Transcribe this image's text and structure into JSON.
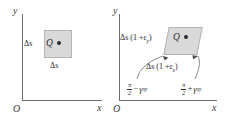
{
  "figure": {
    "panels": [
      {
        "id": "undeformed",
        "axis_y_label": "y",
        "axis_x_label": "x",
        "origin_label": "O",
        "point_label": "Q",
        "dim_left": "Δs",
        "dim_bottom": "Δs",
        "shape": "square"
      },
      {
        "id": "deformed",
        "axis_y_label": "y",
        "axis_x_label": "x",
        "origin_label": "O",
        "point_label": "Q",
        "dim_left_main": "Δs (1 +",
        "dim_left_sub": "y",
        "dim_left_close": ")",
        "dim_mid_main": "Δs (1 +",
        "dim_mid_sub": "x",
        "dim_mid_close": ")",
        "angle_left": {
          "numerator": "π",
          "denominator": "2",
          "operator": "−",
          "symbol": "γ",
          "subscript": "xy"
        },
        "angle_right": {
          "numerator": "π",
          "denominator": "2",
          "operator": "+",
          "symbol": "γ",
          "subscript": "xy"
        },
        "shape": "parallelogram"
      }
    ],
    "symbols": {
      "epsilon": "ε",
      "delta_s": "Δs"
    },
    "colors": {
      "element_fill": "#d9d9d9",
      "element_stroke": "#b4b4b4",
      "axis": "#6d6d6d",
      "text": "#2a2a2a",
      "background": "#ffffff"
    }
  }
}
